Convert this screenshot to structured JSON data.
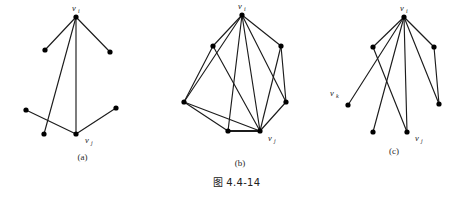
{
  "figure": {
    "main_caption": "图 4.4-14",
    "background_color": "#ffffff",
    "line_color": "#1c1c1c",
    "node_color": "#000000",
    "panels": [
      {
        "id": "a",
        "subcaption": "(a)",
        "labels": {
          "vi": "v",
          "vi_sub": "i",
          "vj": "v",
          "vj_sub": "j"
        },
        "vertex_count": 6,
        "edge_count": 5
      },
      {
        "id": "b",
        "subcaption": "(b)",
        "labels": {
          "vi": "v",
          "vi_sub": "i",
          "vj": "v",
          "vj_sub": "j"
        },
        "vertex_count": 7,
        "edge_count": 10
      },
      {
        "id": "c",
        "subcaption": "(c)",
        "labels": {
          "vi": "v",
          "vi_sub": "i",
          "vj": "v",
          "vj_sub": "j",
          "vk": "v",
          "vk_sub": "k"
        },
        "vertex_count": 7,
        "edge_count": 8
      }
    ]
  }
}
